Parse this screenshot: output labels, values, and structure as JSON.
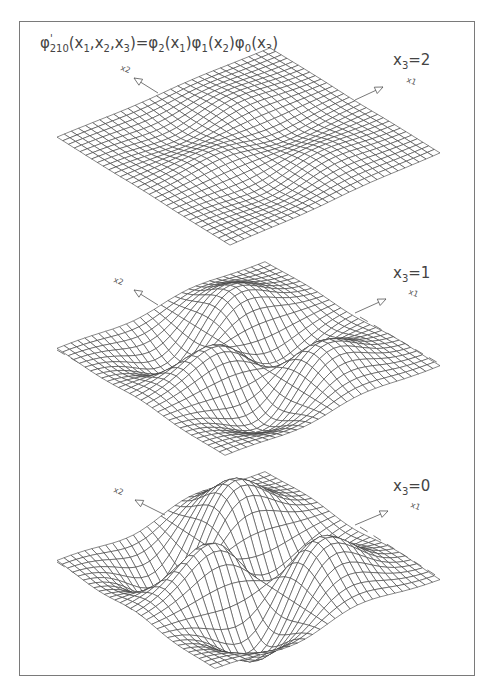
{
  "figure": {
    "title_parts": {
      "lhs_func": "φ",
      "lhs_sup": "'",
      "lhs_sub": "210",
      "lhs_args": "(x",
      "a1": "1",
      "comma1": ",x",
      "a2": "2",
      "comma2": ",x",
      "a3": "3",
      "close": ")=",
      "f1": "φ",
      "f1_sub": "2",
      "f1_args": "(x",
      "f1_a": "1",
      "f1_close": ")",
      "f2": "φ",
      "f2_sub": "1",
      "f2_args": "(x",
      "f2_a": "2",
      "f2_close": ")",
      "f3": "φ",
      "f3_sub": "0",
      "f3_args": "(x",
      "f3_a": "3",
      "f3_close": ")"
    },
    "title": "φ'210(x1,x2,x3)=φ2(x1)φ1(x2)φ0(x3)",
    "frame_color": "#7a7a7a",
    "mesh_color": "#3a3a3a"
  },
  "chart_data": [
    {
      "type": "surface",
      "title": "φ'210(x1,x2,x3)=φ2(x1)φ1(x2)φ0(x3)",
      "slice_label": "x3=2",
      "slice_var": "x",
      "slice_sub": "3",
      "slice_value": "=2",
      "x_axis_label": "x1",
      "y_axis_label": "x2",
      "quantum_numbers": {
        "n1": 2,
        "n2": 1,
        "n3": 0
      },
      "x3": 2,
      "relative_amplitude": 0.135,
      "projection": {
        "top": [
          270,
          48
        ],
        "left": [
          57,
          137
        ],
        "right": [
          440,
          153
        ],
        "bottom": [
          230,
          245
        ]
      },
      "height_scale": 75,
      "label_pos": [
        393,
        51
      ],
      "arrow_x2": {
        "from": [
          158,
          93
        ],
        "to": [
          134,
          78
        ],
        "label_pos": [
          120,
          70
        ]
      },
      "arrow_x1": {
        "from": [
          355,
          100
        ],
        "to": [
          383,
          87
        ],
        "label_pos": [
          406,
          82
        ]
      },
      "dashes": false
    },
    {
      "type": "surface",
      "title": "φ'210(x1,x2,x3)=φ2(x1)φ1(x2)φ0(x3)",
      "slice_label": "x3=1",
      "slice_var": "x",
      "slice_sub": "3",
      "slice_value": "=1",
      "x_axis_label": "x1",
      "y_axis_label": "x2",
      "quantum_numbers": {
        "n1": 2,
        "n2": 1,
        "n3": 0
      },
      "x3": 1,
      "relative_amplitude": 0.607,
      "projection": {
        "top": [
          265,
          262
        ],
        "left": [
          57,
          348
        ],
        "right": [
          440,
          366
        ],
        "bottom": [
          225,
          455
        ]
      },
      "height_scale": 75,
      "label_pos": [
        393,
        264
      ],
      "arrow_x2": {
        "from": [
          158,
          305
        ],
        "to": [
          134,
          290
        ],
        "label_pos": [
          113,
          282
        ]
      },
      "arrow_x1": {
        "from": [
          355,
          313
        ],
        "to": [
          386,
          299
        ],
        "label_pos": [
          408,
          294
        ]
      },
      "dashes": true
    },
    {
      "type": "surface",
      "title": "φ'210(x1,x2,x3)=φ2(x1)φ1(x2)φ0(x3)",
      "slice_label": "x3=0",
      "slice_var": "x",
      "slice_sub": "3",
      "slice_value": "=0",
      "x_axis_label": "x1",
      "y_axis_label": "x2",
      "quantum_numbers": {
        "n1": 2,
        "n2": 1,
        "n3": 0
      },
      "x3": 0,
      "relative_amplitude": 1.0,
      "projection": {
        "top": [
          265,
          472
        ],
        "left": [
          57,
          560
        ],
        "right": [
          440,
          580
        ],
        "bottom": [
          215,
          668
        ]
      },
      "height_scale": 75,
      "label_pos": [
        393,
        477
      ],
      "arrow_x2": {
        "from": [
          165,
          515
        ],
        "to": [
          135,
          500
        ],
        "label_pos": [
          113,
          492
        ]
      },
      "arrow_x1": {
        "from": [
          355,
          525
        ],
        "to": [
          388,
          511
        ],
        "label_pos": [
          410,
          507
        ]
      },
      "dashes": true
    }
  ],
  "grid": {
    "n": 30,
    "range": 3.0
  }
}
